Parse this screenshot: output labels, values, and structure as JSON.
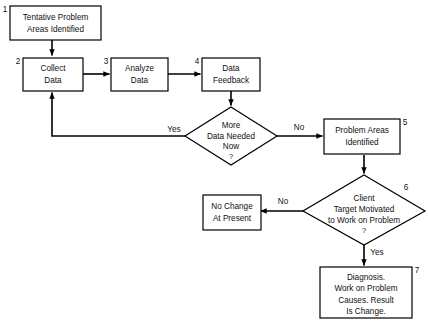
{
  "diagram": {
    "background_color": "#ffffff",
    "line_color": "#000000",
    "text_color": "#111111"
  },
  "nodes": [
    {
      "id": "n1",
      "number": "1",
      "shape": "rectangle",
      "lines": [
        "Tentative Problem",
        "Areas Identified"
      ]
    },
    {
      "id": "n2",
      "number": "2",
      "shape": "rectangle",
      "lines": [
        "Collect",
        "Data"
      ]
    },
    {
      "id": "n3",
      "number": "3",
      "shape": "rectangle",
      "lines": [
        "Analyze",
        "Data"
      ]
    },
    {
      "id": "n4",
      "number": "4",
      "shape": "rectangle",
      "lines": [
        "Data",
        "Feedback"
      ]
    },
    {
      "id": "d1",
      "number": "",
      "shape": "diamond",
      "lines": [
        "More",
        "Data Needed",
        "Now"
      ],
      "question_mark": "?"
    },
    {
      "id": "n5",
      "number": "5",
      "shape": "rectangle",
      "lines": [
        "Problem Areas",
        "Identified"
      ]
    },
    {
      "id": "d2",
      "number": "6",
      "shape": "diamond",
      "lines": [
        "Client",
        "Target Motivated",
        "to Work on Problem"
      ],
      "question_mark": "?"
    },
    {
      "id": "n6",
      "number": "",
      "shape": "rectangle",
      "lines": [
        "No Change",
        "At Present"
      ]
    },
    {
      "id": "n7",
      "number": "7",
      "shape": "rectangle",
      "lines": [
        "Diagnosis.",
        "Work on Problem",
        "Causes. Result",
        "Is Change."
      ]
    }
  ],
  "edge_labels": {
    "more_data_yes": "Yes",
    "more_data_no": "No",
    "motivated_no": "No",
    "motivated_yes": "Yes"
  }
}
